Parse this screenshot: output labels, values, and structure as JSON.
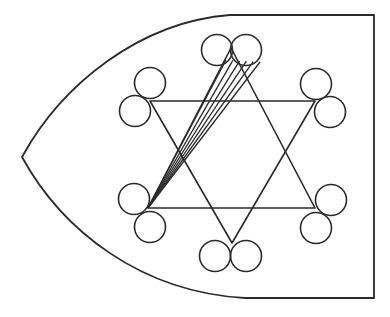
{
  "diagram": {
    "ink_color": "#2a2a2a",
    "background_color": "#ffffff",
    "outline": {
      "shape": "bullet",
      "pointed_side": "left",
      "flat_side": "right"
    },
    "star": {
      "type": "hexagram",
      "triangles": [
        "upward",
        "downward"
      ],
      "points": [
        "top",
        "upper-right",
        "lower-right",
        "bottom",
        "lower-left",
        "upper-left"
      ]
    },
    "circle_pairs": [
      {
        "at": "top",
        "count": 2,
        "arrangement": "side-by-side"
      },
      {
        "at": "upper-right",
        "count": 2,
        "arrangement": "diagonal"
      },
      {
        "at": "lower-right",
        "count": 2,
        "arrangement": "diagonal"
      },
      {
        "at": "bottom",
        "count": 2,
        "arrangement": "side-by-side"
      },
      {
        "at": "lower-left",
        "count": 2,
        "arrangement": "diagonal"
      },
      {
        "at": "upper-left",
        "count": 2,
        "arrangement": "diagonal"
      }
    ],
    "fan_lines": {
      "from": "top circle pair",
      "to": "lower-left star point",
      "count": 6
    }
  }
}
